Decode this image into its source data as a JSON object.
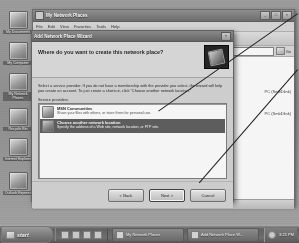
{
  "desktop": {
    "icons": [
      {
        "name": "my-documents",
        "label": "My Documents"
      },
      {
        "name": "my-computer",
        "label": "My Computer"
      },
      {
        "name": "my-network-places",
        "label": "My Network Places"
      },
      {
        "name": "recycle-bin",
        "label": "Recycle Bin"
      },
      {
        "name": "internet-explorer",
        "label": "Internet Explorer"
      },
      {
        "name": "outlook-express",
        "label": "Outlook Express"
      }
    ]
  },
  "explorer": {
    "title": "My Network Places",
    "window_buttons": {
      "minimize": "_",
      "maximize": "□",
      "close": "×"
    },
    "menu": [
      "File",
      "Edit",
      "View",
      "Favorites",
      "Tools",
      "Help"
    ],
    "address_label": "Address",
    "address_value": "",
    "go_label": "Go",
    "files": [
      {
        "label": "PC (SmbDlink)"
      },
      {
        "label": "PC (SmbDlink)"
      }
    ],
    "status": ""
  },
  "wizard": {
    "title": "Add Network Place Wizard",
    "close_label": "×",
    "heading": "Where do you want to create this network place?",
    "body_text": "Select a service provider. If you do not have a membership with the provider you select, the wizard will help you create an account. To just create a shortcut, click \"Choose another network location.\"",
    "list_label": "Service providers:",
    "providers": [
      {
        "name": "msn-communities",
        "icon": "msn-butterfly-icon",
        "title": "MSN Communities",
        "subtitle": "Share your files with others, or store them for personal use.",
        "selected": false
      },
      {
        "name": "choose-another-network-location",
        "icon": "network-folder-icon",
        "title": "Choose another network location",
        "subtitle": "Specify the address of a Web site, network location, or FTP site.",
        "selected": true
      }
    ],
    "buttons": {
      "back": "< Back",
      "next": "Next >",
      "cancel": "Cancel"
    }
  },
  "taskbar": {
    "start_label": "start",
    "quick_launch_count": 4,
    "tasks": [
      {
        "name": "task-my-network-places",
        "label": "My Network Places"
      },
      {
        "name": "task-add-network-place-wizard",
        "label": "Add Network Place W..."
      }
    ],
    "clock": "3:21 PM"
  },
  "colors": {
    "selection": "#5a5a5a",
    "titlebar": "#6b6b6b",
    "dialog_face": "#d4d4d4",
    "annotation": "#1a1a1a"
  }
}
